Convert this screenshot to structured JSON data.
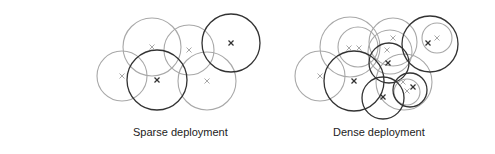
{
  "colors": {
    "background": "#ffffff",
    "light_stroke": "#a8a8a8",
    "dark_stroke": "#333333",
    "text": "#222222"
  },
  "panels": [
    {
      "id": "sparse",
      "caption": "Sparse deployment",
      "cells": [
        {
          "cx": 152,
          "cy": 47,
          "r": 29,
          "tone": "light",
          "marks": [
            {
              "x": 152,
              "y": 47,
              "tone": "light"
            }
          ]
        },
        {
          "cx": 189,
          "cy": 50,
          "r": 25,
          "tone": "light",
          "marks": [
            {
              "x": 189,
              "y": 50,
              "tone": "light"
            }
          ]
        },
        {
          "cx": 231,
          "cy": 43,
          "r": 29,
          "tone": "dark",
          "marks": [
            {
              "x": 231,
              "y": 43,
              "tone": "dark"
            }
          ]
        },
        {
          "cx": 122,
          "cy": 76,
          "r": 25,
          "tone": "light",
          "marks": [
            {
              "x": 122,
              "y": 76,
              "tone": "light"
            }
          ]
        },
        {
          "cx": 157,
          "cy": 80,
          "r": 30,
          "tone": "dark",
          "marks": [
            {
              "x": 157,
              "y": 80,
              "tone": "dark"
            }
          ]
        },
        {
          "cx": 207,
          "cy": 81,
          "r": 29,
          "tone": "light",
          "marks": [
            {
              "x": 207,
              "y": 81,
              "tone": "light"
            }
          ]
        }
      ]
    },
    {
      "id": "dense",
      "caption": "Dense deployment",
      "cells": [
        {
          "cx": 350,
          "cy": 47,
          "r": 30,
          "tone": "light",
          "marks": [
            {
              "x": 349,
              "y": 48,
              "tone": "light"
            }
          ]
        },
        {
          "cx": 358,
          "cy": 47,
          "r": 20,
          "tone": "light",
          "marks": [
            {
              "x": 359,
              "y": 48,
              "tone": "light"
            }
          ]
        },
        {
          "cx": 393,
          "cy": 42,
          "r": 24,
          "tone": "light",
          "marks": [
            {
              "x": 393,
              "y": 38,
              "tone": "light"
            }
          ]
        },
        {
          "cx": 390,
          "cy": 52,
          "r": 22,
          "tone": "light",
          "marks": [
            {
              "x": 387,
              "y": 50,
              "tone": "light"
            }
          ]
        },
        {
          "cx": 389,
          "cy": 63,
          "r": 20,
          "tone": "dark",
          "marks": [
            {
              "x": 388,
              "y": 63,
              "tone": "dark"
            }
          ]
        },
        {
          "cx": 430,
          "cy": 44,
          "r": 28,
          "tone": "dark",
          "marks": [
            {
              "x": 428,
              "y": 43,
              "tone": "dark"
            }
          ]
        },
        {
          "cx": 437,
          "cy": 38,
          "r": 15,
          "tone": "light",
          "marks": [
            {
              "x": 437,
              "y": 38,
              "tone": "light"
            }
          ]
        },
        {
          "cx": 320,
          "cy": 76,
          "r": 25,
          "tone": "light",
          "marks": [
            {
              "x": 320,
              "y": 76,
              "tone": "light"
            }
          ]
        },
        {
          "cx": 354,
          "cy": 81,
          "r": 30,
          "tone": "dark",
          "marks": [
            {
              "x": 354,
              "y": 81,
              "tone": "dark"
            }
          ]
        },
        {
          "cx": 404,
          "cy": 82,
          "r": 28,
          "tone": "light",
          "marks": [
            {
              "x": 403,
              "y": 82,
              "tone": "light"
            }
          ]
        },
        {
          "cx": 383,
          "cy": 98,
          "r": 21,
          "tone": "dark",
          "marks": [
            {
              "x": 383,
              "y": 97,
              "tone": "dark"
            }
          ]
        },
        {
          "cx": 410,
          "cy": 90,
          "r": 17,
          "tone": "dark",
          "marks": [
            {
              "x": 413,
              "y": 87,
              "tone": "dark"
            }
          ]
        },
        {
          "cx": 407,
          "cy": 92,
          "r": 13,
          "tone": "light",
          "marks": [
            {
              "x": 407,
              "y": 91,
              "tone": "light"
            }
          ]
        }
      ]
    }
  ]
}
